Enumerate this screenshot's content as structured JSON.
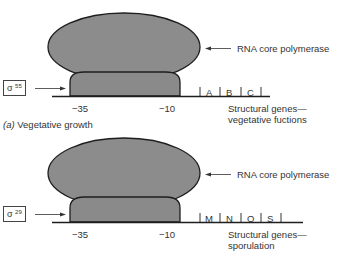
{
  "diagram": {
    "panels": [
      {
        "id": "a",
        "caption_letter": "(a)",
        "caption": "Vegetative growth",
        "polymerase_label": "RNA core polymerase",
        "sigma_symbol": "σ",
        "sigma_superscript": "55",
        "position_labels": [
          "−35",
          "−10"
        ],
        "genes": [
          "A",
          "B",
          "C"
        ],
        "structural_label_line1": "Structural genes—",
        "structural_label_line2": "vegetative fuctions"
      },
      {
        "id": "b",
        "caption_letter": "",
        "caption": "",
        "polymerase_label": "RNA core polymerase",
        "sigma_symbol": "σ",
        "sigma_superscript": "29",
        "position_labels": [
          "−35",
          "−10"
        ],
        "genes": [
          "M",
          "N",
          "O",
          "S"
        ],
        "structural_label_line1": "Structural genes—",
        "structural_label_line2": "sporulation"
      }
    ],
    "colors": {
      "polymerase_fill": "#8c8c8c",
      "sigma_fill": "#8a8a8a",
      "outline": "#1e1e1e",
      "text": "#333333"
    }
  }
}
